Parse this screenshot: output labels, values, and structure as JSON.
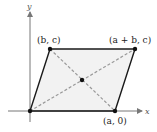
{
  "diagram": {
    "type": "parallelogram-coordinate-plot",
    "axes": {
      "x_label": "x",
      "y_label": "y"
    },
    "vertices": [
      {
        "id": "origin",
        "label": "",
        "px": [
          30,
          111
        ]
      },
      {
        "id": "a0",
        "label": "(a, 0)",
        "px": [
          115,
          111
        ]
      },
      {
        "id": "apb_c",
        "label": "(a + b, c)",
        "px": [
          135,
          49
        ]
      },
      {
        "id": "bc",
        "label": "(b, c)",
        "px": [
          50,
          49
        ]
      }
    ],
    "center": {
      "label": "",
      "px": [
        82,
        80
      ]
    },
    "diagonals": "dashed",
    "colors": {
      "fill": "#f2f2f2",
      "edge": "#1a1a1a",
      "diagonal": "#9a9a9a",
      "axis": "#777777"
    }
  }
}
